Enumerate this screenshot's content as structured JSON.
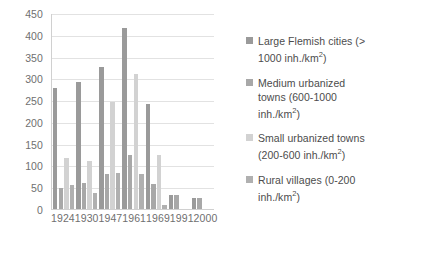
{
  "chart_data": {
    "type": "bar",
    "title": "",
    "xlabel": "",
    "ylabel": "",
    "ylim": [
      0,
      450
    ],
    "ytick_step": 50,
    "yticks": [
      "450",
      "400",
      "350",
      "300",
      "250",
      "200",
      "150",
      "100",
      "50",
      "0"
    ],
    "grid": true,
    "legend_position": "right",
    "categories": [
      "1924",
      "1930",
      "1947",
      "1961",
      "1969",
      "1991",
      "2000"
    ],
    "series": [
      {
        "name": "Large Flemish cities  (> 1000 inh./km²)",
        "label_line1": "Large Flemish cities  (>",
        "label_line2": "1000 inh./km",
        "label_sup": "2",
        "label_tail": ")",
        "color": "#9a9a9a",
        "values": [
          278,
          292,
          325,
          415,
          240,
          32,
          25
        ]
      },
      {
        "name": "Medium urbanized towns (600-1000 inh./km²)",
        "label_line1": "Medium urbanized",
        "label_line2": "towns (600-1000",
        "label_line3": "inh./km",
        "label_sup": "2",
        "label_tail": ")",
        "color": "#a8a8a8",
        "values": [
          48,
          59,
          80,
          123,
          57,
          32,
          25
        ]
      },
      {
        "name": "Small urbanized towns (200-600 inh./km²)",
        "label_line1": "Small urbanized towns",
        "label_line2": "(200-600 inh./km",
        "label_sup": "2",
        "label_tail": ")",
        "color": "#d2d2d2",
        "values": [
          118,
          111,
          245,
          309,
          124,
          0,
          0
        ]
      },
      {
        "name": "Rural villages (0-200 inh./km²)",
        "label_line1": "Rural villages (0-200",
        "label_line2": "inh./km",
        "label_sup": "2",
        "label_tail": ")",
        "color": "#b0b0b0",
        "values": [
          54,
          36,
          83,
          80,
          10,
          0,
          0
        ]
      }
    ]
  }
}
